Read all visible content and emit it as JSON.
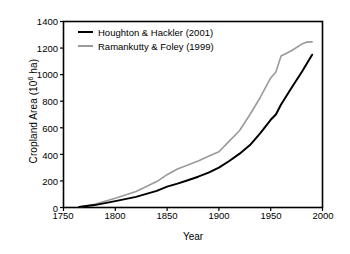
{
  "chart_data": {
    "type": "line",
    "title": "",
    "xlabel": "Year",
    "ylabel_text": "Cropland Area (10",
    "ylabel_sup": "6",
    "ylabel_tail": " ha)",
    "xlim": [
      1750,
      2000
    ],
    "ylim": [
      0,
      1400
    ],
    "xticks": [
      1750,
      1800,
      1850,
      1900,
      1950,
      2000
    ],
    "yticks": [
      0,
      200,
      400,
      600,
      800,
      1000,
      1200,
      1400
    ],
    "grid": false,
    "legend_position": "upper left",
    "series": [
      {
        "name": "Houghton & Hackler (2001)",
        "color": "#000000",
        "width": 2.0,
        "x": [
          1765,
          1780,
          1800,
          1820,
          1840,
          1850,
          1860,
          1870,
          1880,
          1890,
          1900,
          1910,
          1920,
          1930,
          1940,
          1950,
          1955,
          1960,
          1970,
          1980,
          1990
        ],
        "y": [
          3,
          18,
          48,
          80,
          125,
          157,
          180,
          205,
          232,
          262,
          300,
          350,
          405,
          470,
          560,
          660,
          700,
          775,
          900,
          1020,
          1150
        ]
      },
      {
        "name": "Ramankutty & Foley (1999)",
        "color": "#9a9a9a",
        "width": 1.6,
        "x": [
          1765,
          1780,
          1800,
          1820,
          1840,
          1850,
          1860,
          1870,
          1880,
          1890,
          1900,
          1910,
          1920,
          1930,
          1940,
          1950,
          1955,
          1960,
          1970,
          1980,
          1985,
          1990
        ],
        "y": [
          3,
          25,
          70,
          120,
          195,
          247,
          290,
          320,
          350,
          385,
          420,
          500,
          580,
          700,
          830,
          975,
          1020,
          1140,
          1180,
          1230,
          1245,
          1247
        ]
      }
    ]
  },
  "axes": {
    "frame_color": "#000000",
    "background": "#ffffff",
    "tick_direction": "out"
  }
}
